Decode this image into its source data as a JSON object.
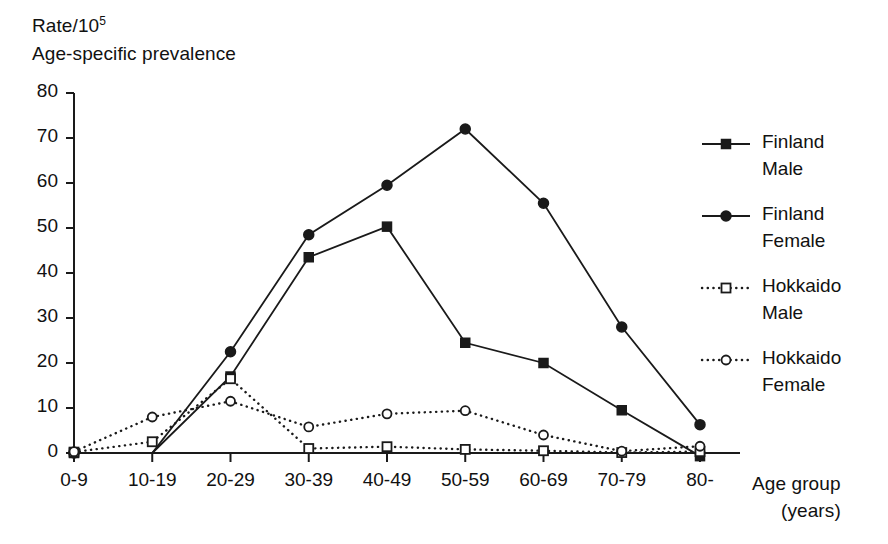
{
  "chart_data": {
    "type": "line",
    "title": "",
    "ylabel_lines": [
      "Rate/10",
      "Age-specific prevalence"
    ],
    "ylabel_superscript": "5",
    "xlabel_lines": [
      "Age group",
      "(years)"
    ],
    "categories": [
      "0-9",
      "10-19",
      "20-29",
      "30-39",
      "40-49",
      "50-59",
      "60-69",
      "70-79",
      "80-"
    ],
    "ylim": [
      0,
      80
    ],
    "yticks": [
      0,
      10,
      20,
      30,
      40,
      50,
      60,
      70,
      80
    ],
    "grid": false,
    "legend_position": "right",
    "series": [
      {
        "name": "Finland Male",
        "label_lines": [
          "Finland",
          "Male"
        ],
        "marker": "filled-square",
        "line": "solid",
        "color": "#1a1a1a",
        "values": [
          0,
          0,
          17,
          43.5,
          50.3,
          24.5,
          20,
          9.5,
          -0.7
        ]
      },
      {
        "name": "Finland Female",
        "label_lines": [
          "Finland",
          "Female"
        ],
        "marker": "filled-circle",
        "line": "solid",
        "color": "#1a1a1a",
        "values": [
          0,
          0,
          22.5,
          48.5,
          59.5,
          72,
          55.5,
          28,
          6.3
        ]
      },
      {
        "name": "Hokkaido Male",
        "label_lines": [
          "Hokkaido",
          "Male"
        ],
        "marker": "open-square",
        "line": "dotted",
        "color": "#1a1a1a",
        "values": [
          0.2,
          2.5,
          16.5,
          1.0,
          1.4,
          0.8,
          0.5,
          0.1,
          0.3
        ]
      },
      {
        "name": "Hokkaido Female",
        "label_lines": [
          "Hokkaido",
          "Female"
        ],
        "marker": "open-circle",
        "line": "dotted",
        "color": "#1a1a1a",
        "values": [
          0.3,
          8.0,
          11.5,
          5.8,
          8.7,
          9.4,
          4.0,
          0.4,
          1.5
        ]
      }
    ]
  },
  "axes": {
    "ytick_labels": [
      "80",
      "70",
      "60",
      "50",
      "40",
      "30",
      "20",
      "10",
      "0"
    ],
    "xtick_labels": [
      "0-9",
      "10-19",
      "20-29",
      "30-39",
      "40-49",
      "50-59",
      "60-69",
      "70-79",
      "80-"
    ]
  },
  "ylabel": {
    "line1_prefix": "Rate/10",
    "line1_sup": "5",
    "line2": "Age-specific prevalence"
  },
  "xlabel": {
    "line1": "Age group",
    "line2": "(years)"
  },
  "legend": {
    "entries": [
      {
        "line1": "Finland",
        "line2": "Male",
        "marker": "filled-square",
        "line": "solid"
      },
      {
        "line1": "Finland",
        "line2": "Female",
        "marker": "filled-circle",
        "line": "solid"
      },
      {
        "line1": "Hokkaido",
        "line2": "Male",
        "marker": "open-square",
        "line": "dotted"
      },
      {
        "line1": "Hokkaido",
        "line2": "Female",
        "marker": "open-circle",
        "line": "dotted"
      }
    ]
  },
  "colors": {
    "ink": "#1a1a1a",
    "background": "#ffffff"
  }
}
